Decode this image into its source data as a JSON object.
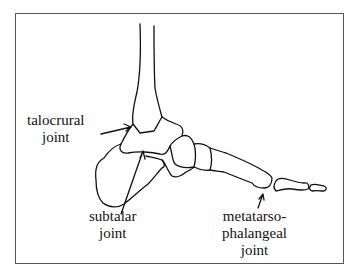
{
  "diagram": {
    "type": "anatomical line drawing",
    "colors": {
      "line": "#111111",
      "frame": "#555555",
      "background": "#ffffff"
    },
    "labels": [
      {
        "id": "talocrural",
        "lines": [
          "talocrural",
          "joint"
        ]
      },
      {
        "id": "subtalar",
        "lines": [
          "subtalar",
          "joint"
        ]
      },
      {
        "id": "metatarsophalangeal",
        "lines": [
          "metatarso-",
          "phalangeal",
          "joint"
        ]
      }
    ]
  }
}
